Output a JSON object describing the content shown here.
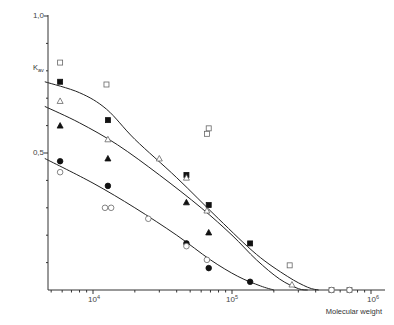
{
  "chart_data": {
    "type": "scatter",
    "title": "",
    "xlabel": "Molecular weight",
    "ylabel": "Kav",
    "xscale": "log",
    "xlim": [
      4500,
      1000000
    ],
    "ylim": [
      0,
      1.0
    ],
    "grid": false,
    "legend": null,
    "y_ticks": [
      0.1,
      0.2,
      0.3,
      0.4,
      0.5,
      0.6,
      0.7,
      0.8,
      0.9,
      1.0
    ],
    "y_tick_labels": {
      "1.0": "1,0",
      "0.5": "0,5"
    },
    "x_tick_labels": [
      {
        "value": 10000,
        "label": "10^4"
      },
      {
        "value": 100000,
        "label": "10^5"
      },
      {
        "value": 1000000,
        "label": "10^6"
      }
    ],
    "series": [
      {
        "name": "open squares",
        "marker": "square-open",
        "x": [
          5800,
          12500,
          68000,
          66000,
          260000,
          520000,
          700000
        ],
        "y": [
          0.83,
          0.75,
          0.59,
          0.57,
          0.09,
          0.0,
          0.0
        ]
      },
      {
        "name": "filled squares",
        "marker": "square-filled",
        "x": [
          5800,
          12800,
          47000,
          68000,
          135000
        ],
        "y": [
          0.76,
          0.62,
          0.42,
          0.31,
          0.17
        ]
      },
      {
        "name": "open triangles",
        "marker": "triangle-open",
        "x": [
          5800,
          12800,
          30000,
          47000,
          66000,
          270000
        ],
        "y": [
          0.69,
          0.55,
          0.48,
          0.41,
          0.29,
          0.02
        ]
      },
      {
        "name": "filled triangles",
        "marker": "triangle-filled",
        "x": [
          5800,
          12800,
          47000,
          68000
        ],
        "y": [
          0.6,
          0.48,
          0.32,
          0.21
        ]
      },
      {
        "name": "filled circles",
        "marker": "circle-filled",
        "x": [
          5800,
          12800,
          47000,
          68000,
          135000
        ],
        "y": [
          0.47,
          0.38,
          0.17,
          0.08,
          0.03
        ]
      },
      {
        "name": "open circles",
        "marker": "circle-open",
        "x": [
          5800,
          12200,
          13500,
          25000,
          47000,
          66000,
          520000,
          700000
        ],
        "y": [
          0.43,
          0.3,
          0.3,
          0.26,
          0.16,
          0.11,
          0.0,
          0.0
        ]
      }
    ],
    "curves": [
      {
        "name": "upper fit",
        "points": [
          [
            4500,
            0.76
          ],
          [
            8000,
            0.72
          ],
          [
            12500,
            0.66
          ],
          [
            20000,
            0.55
          ],
          [
            40000,
            0.41
          ],
          [
            80000,
            0.26
          ],
          [
            150000,
            0.13
          ],
          [
            250000,
            0.05
          ],
          [
            350000,
            0.01
          ],
          [
            420000,
            0.0
          ]
        ]
      },
      {
        "name": "middle fit",
        "points": [
          [
            4500,
            0.67
          ],
          [
            8000,
            0.61
          ],
          [
            15000,
            0.53
          ],
          [
            30000,
            0.42
          ],
          [
            60000,
            0.3
          ],
          [
            100000,
            0.2
          ],
          [
            150000,
            0.11
          ],
          [
            220000,
            0.04
          ],
          [
            300000,
            0.005
          ],
          [
            350000,
            0.0
          ]
        ]
      },
      {
        "name": "lower fit",
        "points": [
          [
            4500,
            0.48
          ],
          [
            10000,
            0.39
          ],
          [
            20000,
            0.3
          ],
          [
            40000,
            0.2
          ],
          [
            70000,
            0.11
          ],
          [
            110000,
            0.05
          ],
          [
            160000,
            0.015
          ],
          [
            200000,
            0.0
          ]
        ]
      }
    ]
  },
  "labels": {
    "y_axis_title": "Kav",
    "x_axis_title": "Molecular weight",
    "y_top": "1,0",
    "y_mid": "0,5",
    "x_1e4": "10",
    "x_1e5": "10",
    "x_1e6": "10",
    "exp_4": "4",
    "exp_5": "5",
    "exp_6": "6"
  }
}
